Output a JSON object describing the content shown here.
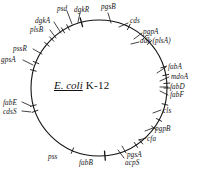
{
  "figure": {
    "title_species": "E. coli",
    "title_strain": "K-12",
    "background_color": "#ffffff",
    "line_color": "#141414",
    "circle": {
      "center_x": 99,
      "center_y": 88,
      "radius": 68
    }
  },
  "genes": [
    {
      "name": "pgsB",
      "angle_deg": 345,
      "label_x": 101,
      "label_y": 4,
      "tick": "major"
    },
    {
      "name": "cds",
      "angle_deg": 26,
      "label_x": 130,
      "label_y": 18,
      "tick": "minor"
    },
    {
      "name": "pgpA",
      "angle_deg": 42,
      "label_x": 143,
      "label_y": 29,
      "tick": "minor"
    },
    {
      "name": "adk (plsA)",
      "angle_deg": 48,
      "label_x": 140,
      "label_y": 38,
      "tick": "minor"
    },
    {
      "name": "fabA",
      "angle_deg": 72,
      "label_x": 168,
      "label_y": 64,
      "tick": "minor"
    },
    {
      "name": "mdoA",
      "angle_deg": 79,
      "label_x": 171,
      "label_y": 74,
      "tick": "minor"
    },
    {
      "name": "fabD",
      "angle_deg": 86,
      "label_x": 170,
      "label_y": 84,
      "tick": "minor"
    },
    {
      "name": "fabF",
      "angle_deg": 90,
      "label_x": 170,
      "label_y": 92,
      "tick": "minor"
    },
    {
      "name": "cls",
      "angle_deg": 104,
      "label_x": 163,
      "label_y": 108,
      "tick": "minor"
    },
    {
      "name": "pgpB",
      "angle_deg": 118,
      "label_x": 155,
      "label_y": 126,
      "tick": "minor"
    },
    {
      "name": "cfa",
      "angle_deg": 126,
      "label_x": 147,
      "label_y": 136,
      "tick": "minor"
    },
    {
      "name": "pgsA",
      "angle_deg": 142,
      "label_x": 127,
      "label_y": 152,
      "tick": "minor"
    },
    {
      "name": "acpS",
      "angle_deg": 147,
      "label_x": 125,
      "label_y": 160,
      "tick": "minor"
    },
    {
      "name": "fabB",
      "angle_deg": 175,
      "label_x": 79,
      "label_y": 160,
      "tick": "major"
    },
    {
      "name": "pss",
      "angle_deg": 203,
      "label_x": 48,
      "label_y": 154,
      "tick": "minor"
    },
    {
      "name": "cdsS",
      "angle_deg": 250,
      "label_x": 3,
      "label_y": 109,
      "tick": "minor"
    },
    {
      "name": "fabE",
      "angle_deg": 255,
      "label_x": 3,
      "label_y": 100,
      "tick": "minor"
    },
    {
      "name": "gpsA",
      "angle_deg": 285,
      "label_x": 1,
      "label_y": 57,
      "tick": "minor"
    },
    {
      "name": "pssR",
      "angle_deg": 292,
      "label_x": 13,
      "label_y": 46,
      "tick": "minor"
    },
    {
      "name": "plsB",
      "angle_deg": 310,
      "label_x": 30,
      "label_y": 27,
      "tick": "minor"
    },
    {
      "name": "dgkA",
      "angle_deg": 316,
      "label_x": 35,
      "label_y": 18,
      "tick": "minor"
    },
    {
      "name": "psd",
      "angle_deg": 328,
      "label_x": 57,
      "label_y": 6,
      "tick": "minor"
    },
    {
      "name": "dgkR",
      "angle_deg": 333,
      "label_x": 74,
      "label_y": 7,
      "tick": "minor"
    }
  ],
  "leaders": [
    {
      "gene": "pgsB",
      "x1": 108,
      "y1": 13,
      "x2": 111,
      "y2": 23
    },
    {
      "gene": "cds",
      "x1": 128,
      "y1": 23,
      "x2": 119,
      "y2": 27
    },
    {
      "gene": "pgpA",
      "x1": 142,
      "y1": 33,
      "x2": 134,
      "y2": 39
    },
    {
      "gene": "adk",
      "x1": 139,
      "y1": 42,
      "x2": 131,
      "y2": 44
    },
    {
      "gene": "fabA",
      "x1": 166,
      "y1": 67,
      "x2": 157,
      "y2": 73
    },
    {
      "gene": "mdoA",
      "x1": 169,
      "y1": 77,
      "x2": 160,
      "y2": 81
    },
    {
      "gene": "fabD",
      "x1": 168,
      "y1": 87,
      "x2": 160,
      "y2": 87
    },
    {
      "gene": "fabF",
      "x1": 168,
      "y1": 95,
      "x2": 160,
      "y2": 91
    },
    {
      "gene": "cls",
      "x1": 161,
      "y1": 110,
      "x2": 153,
      "y2": 113
    },
    {
      "gene": "pgpB",
      "x1": 153,
      "y1": 128,
      "x2": 145,
      "y2": 131
    },
    {
      "gene": "cfa",
      "x1": 146,
      "y1": 138,
      "x2": 139,
      "y2": 140
    },
    {
      "gene": "pgsA",
      "x1": 126,
      "y1": 153,
      "x2": 122,
      "y2": 146
    },
    {
      "gene": "acpS",
      "x1": 124,
      "y1": 158,
      "x2": 118,
      "y2": 150
    },
    {
      "gene": "fabE",
      "x1": 22,
      "y1": 102,
      "x2": 31,
      "y2": 106
    },
    {
      "gene": "cdsS",
      "x1": 22,
      "y1": 111,
      "x2": 31,
      "y2": 112
    },
    {
      "gene": "gpsA",
      "x1": 23,
      "y1": 60,
      "x2": 33,
      "y2": 65
    },
    {
      "gene": "pssR",
      "x1": 33,
      "y1": 49,
      "x2": 42,
      "y2": 54
    },
    {
      "gene": "plsB",
      "x1": 50,
      "y1": 30,
      "x2": 56,
      "y2": 38
    },
    {
      "gene": "dgkA",
      "x1": 54,
      "y1": 22,
      "x2": 61,
      "y2": 33
    },
    {
      "gene": "psd",
      "x1": 67,
      "y1": 11,
      "x2": 72,
      "y2": 24
    },
    {
      "gene": "dgkR",
      "x1": 80,
      "y1": 13,
      "x2": 78,
      "y2": 22
    }
  ]
}
